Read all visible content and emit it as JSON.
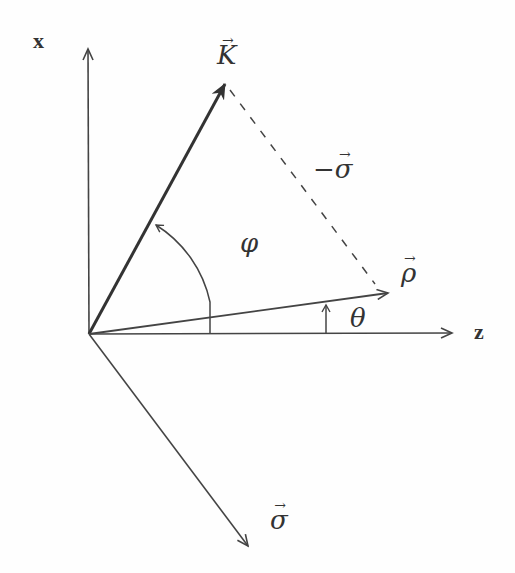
{
  "diagram": {
    "axes": {
      "x_label": "x",
      "z_label": "z"
    },
    "vectors": {
      "K": {
        "label": "K",
        "arrow": "→"
      },
      "rho": {
        "label": "ρ",
        "arrow": "→"
      },
      "sigma": {
        "label": "σ",
        "arrow": "→"
      },
      "neg_sigma": {
        "prefix": "−",
        "label": "σ",
        "arrow": "→"
      }
    },
    "angles": {
      "phi": "φ",
      "theta": "θ"
    },
    "colors": {
      "line": "#444444",
      "background": "#fefefe"
    }
  }
}
